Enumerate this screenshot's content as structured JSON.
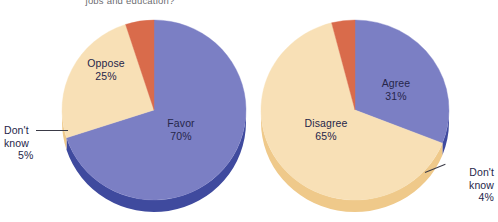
{
  "caption": {
    "text": "jobs and education?"
  },
  "colors": {
    "purple": "#7b7fc4",
    "purple_rim": "#3f4a9e",
    "cream": "#f8e0b6",
    "cream_rim": "#efc98a",
    "orange": "#d96b4b",
    "orange_rim": "#b4472c",
    "label_text": "#26264a",
    "caption_text": "#6d6d72",
    "background": "#ffffff"
  },
  "chart_data": [
    {
      "type": "pie",
      "name": "left-pie",
      "title": "",
      "start_angle_deg": 0,
      "direction": "clockwise",
      "legend": "none",
      "labels_inside": true,
      "categories": [
        "Favor",
        "Oppose",
        "Don't know"
      ],
      "values": [
        70,
        25,
        5
      ],
      "unit": "%",
      "slices": [
        {
          "label": "Favor",
          "value": 70,
          "display": "70%",
          "color": "#7b7fc4",
          "rim": "#3f4a9e"
        },
        {
          "label": "Oppose",
          "value": 25,
          "display": "25%",
          "color": "#f8e0b6",
          "rim": "#efc98a"
        },
        {
          "label": "Don't know",
          "value": 5,
          "display": "5%",
          "color": "#d96b4b",
          "rim": "#b4472c"
        }
      ]
    },
    {
      "type": "pie",
      "name": "right-pie",
      "title": "",
      "start_angle_deg": 0,
      "direction": "clockwise",
      "legend": "none",
      "labels_inside": true,
      "categories": [
        "Agree",
        "Disagree",
        "Don't know"
      ],
      "values": [
        31,
        65,
        4
      ],
      "unit": "%",
      "slices": [
        {
          "label": "Agree",
          "value": 31,
          "display": "31%",
          "color": "#7b7fc4",
          "rim": "#3f4a9e"
        },
        {
          "label": "Disagree",
          "value": 65,
          "display": "65%",
          "color": "#f8e0b6",
          "rim": "#efc98a"
        },
        {
          "label": "Don't know",
          "value": 4,
          "display": "4%",
          "color": "#d96b4b",
          "rim": "#b4472c"
        }
      ]
    }
  ],
  "left_labels": {
    "favor_name": "Favor",
    "favor_pct": "70%",
    "oppose_name": "Oppose",
    "oppose_pct": "25%",
    "dk_line1": "Don't",
    "dk_line2": "know",
    "dk_pct": "5%"
  },
  "right_labels": {
    "agree_name": "Agree",
    "agree_pct": "31%",
    "disagree_name": "Disagree",
    "disagree_pct": "65%",
    "dk_line1": "Don't",
    "dk_line2": "know",
    "dk_pct": "4%"
  }
}
